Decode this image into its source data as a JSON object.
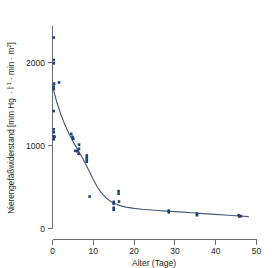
{
  "figure": {
    "background_color": "#ffffff",
    "point_color": "#1d3f7c",
    "curve_color": "#4a5a78",
    "axis_color": "#6d6e71",
    "text_color": "#231f20"
  },
  "axes": {
    "x_title": "Alter (Tage)",
    "y_title_main": "Nierengefäßwiderstand [mm Hg",
    "y_title_unit_1": "l",
    "y_title_exp_1": "-1",
    "y_title_unit_2": "min",
    "y_title_unit_3": "m",
    "y_title_exp_2": "2",
    "y_title_close": "]",
    "y_title_full": "Nierengefäßwiderstand [mm Hg · l-1 · min · m2]",
    "x_ticks": [
      "0",
      "10",
      "20",
      "30",
      "40",
      "50"
    ],
    "y_ticks": [
      "0",
      "1000",
      "2000"
    ]
  },
  "chart_data": {
    "type": "scatter",
    "title": "",
    "xlabel": "Alter (Tage)",
    "ylabel": "Nierengefäßwiderstand [mm Hg · l-1 · min · m2]",
    "xlim": [
      0,
      50
    ],
    "ylim": [
      0,
      2460
    ],
    "xticks": [
      0,
      10,
      20,
      30,
      40,
      50
    ],
    "yticks": [
      0,
      1000,
      2000
    ],
    "grid": false,
    "legend": null,
    "series": [
      {
        "name": "Messwerte",
        "type": "scatter",
        "marker": "square",
        "color": "#1d3f7c",
        "points": [
          [
            0.3,
            2300
          ],
          [
            0.3,
            2030
          ],
          [
            0.3,
            1990
          ],
          [
            0.4,
            1745
          ],
          [
            0.3,
            1710
          ],
          [
            0.3,
            1680
          ],
          [
            1.6,
            1760
          ],
          [
            0.3,
            1415
          ],
          [
            0.3,
            1195
          ],
          [
            0.3,
            1160
          ],
          [
            0.3,
            1110
          ],
          [
            0.5,
            1105
          ],
          [
            0.3,
            1075
          ],
          [
            4.6,
            1140
          ],
          [
            4.9,
            1105
          ],
          [
            5.1,
            1080
          ],
          [
            6.5,
            1010
          ],
          [
            6.5,
            960
          ],
          [
            5.6,
            935
          ],
          [
            6.1,
            930
          ],
          [
            6.4,
            900
          ],
          [
            8.4,
            880
          ],
          [
            8.4,
            855
          ],
          [
            8.4,
            830
          ],
          [
            8.4,
            805
          ],
          [
            9.1,
            385
          ],
          [
            16.2,
            450
          ],
          [
            16.2,
            420
          ],
          [
            15.0,
            320
          ],
          [
            16.3,
            325
          ],
          [
            15.0,
            300
          ],
          [
            15.0,
            250
          ],
          [
            15.0,
            225
          ],
          [
            28.5,
            215
          ],
          [
            28.5,
            195
          ],
          [
            35.4,
            180
          ],
          [
            35.4,
            160
          ],
          [
            45.6,
            160
          ],
          [
            45.8,
            145
          ],
          [
            46.2,
            150
          ]
        ]
      },
      {
        "name": "Regressionskurve",
        "type": "line",
        "color": "#4a5a78",
        "model": "exponential decay with offset",
        "points": [
          [
            0.3,
            1660
          ],
          [
            1.0,
            1530
          ],
          [
            2.0,
            1380
          ],
          [
            3.0,
            1255
          ],
          [
            4.0,
            1145
          ],
          [
            5.0,
            1050
          ],
          [
            6.0,
            965
          ],
          [
            7.0,
            880
          ],
          [
            8.0,
            790
          ],
          [
            9.0,
            690
          ],
          [
            10.0,
            590
          ],
          [
            11.0,
            500
          ],
          [
            12.0,
            430
          ],
          [
            13.0,
            375
          ],
          [
            14.0,
            335
          ],
          [
            15.0,
            305
          ],
          [
            16.0,
            285
          ],
          [
            17.0,
            270
          ],
          [
            18.0,
            258
          ],
          [
            20.0,
            243
          ],
          [
            22.0,
            232
          ],
          [
            25.0,
            220
          ],
          [
            28.0,
            210
          ],
          [
            31.0,
            200
          ],
          [
            34.0,
            190
          ],
          [
            37.0,
            180
          ],
          [
            40.0,
            170
          ],
          [
            43.0,
            160
          ],
          [
            46.0,
            150
          ],
          [
            48.0,
            143
          ]
        ]
      }
    ]
  }
}
